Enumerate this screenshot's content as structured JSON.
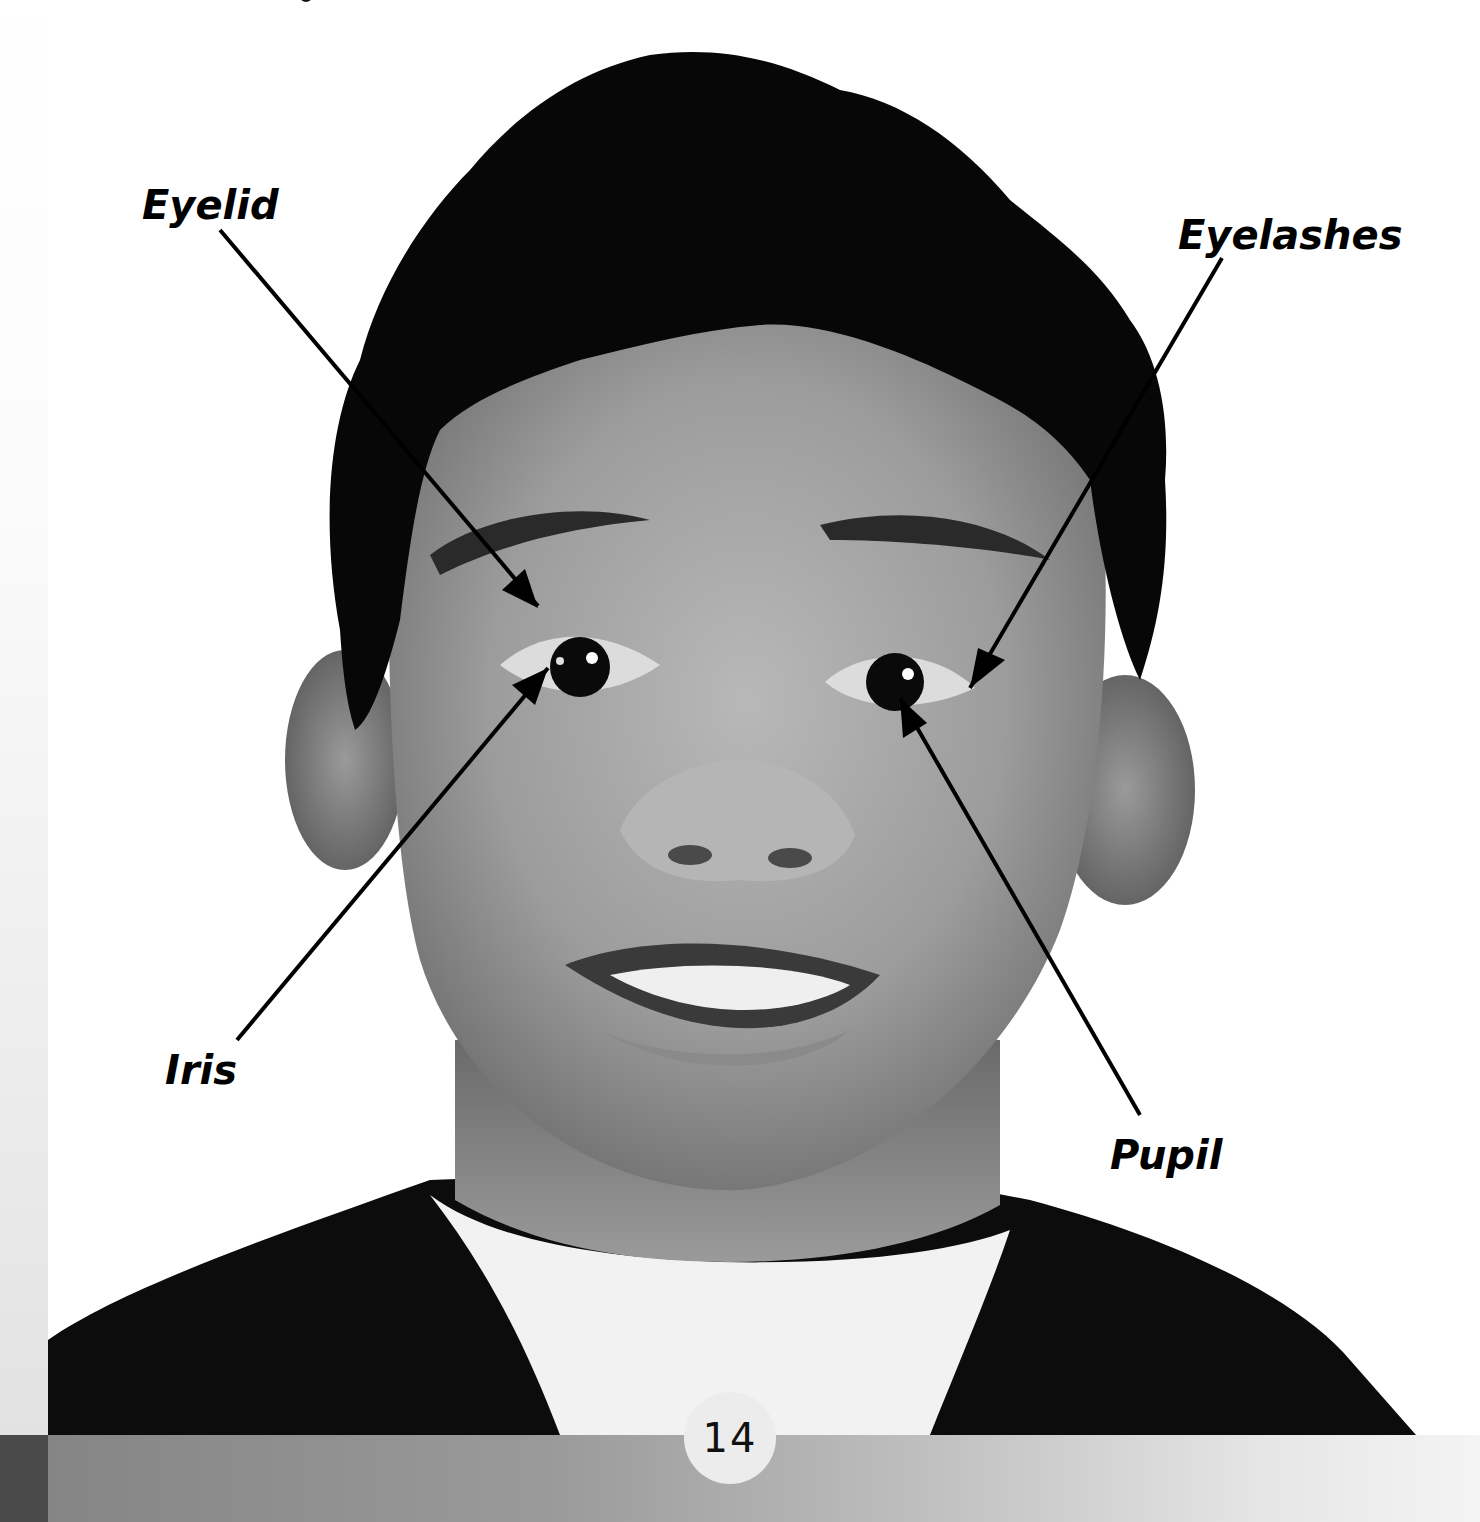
{
  "page": {
    "page_number": "14",
    "colors": {
      "background": "#ffffff",
      "bottom_bar_start": "#858585",
      "bottom_bar_end": "#f4f4f4",
      "left_strip_dark": "#4a4a4a",
      "page_circle": "#ececec",
      "label_color": "#000000"
    }
  },
  "figure": {
    "labels": [
      {
        "id": "eyelid",
        "text": "Eyelid"
      },
      {
        "id": "eyelashes",
        "text": "Eyelashes"
      },
      {
        "id": "iris",
        "text": "Iris"
      },
      {
        "id": "pupil",
        "text": "Pupil"
      }
    ]
  }
}
